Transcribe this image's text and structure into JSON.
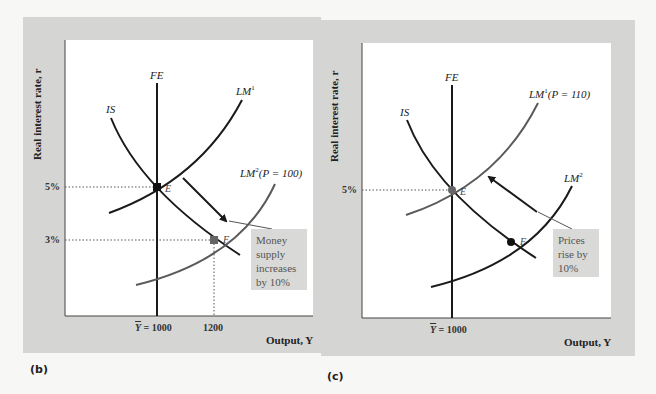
{
  "panels": [
    {
      "tag": "(b)",
      "y_axis_label": "Real interest rate, r",
      "x_axis_label": "Output, Y",
      "y_ticks": [
        "5%",
        "3%"
      ],
      "x_ticks": [
        "Y = 1000",
        "1200"
      ],
      "curves": {
        "fe": "FE",
        "is": "IS",
        "lm1": "LM",
        "lm1_sup": "1",
        "lm1_suffix": "",
        "lm2": "LM",
        "lm2_sup": "2",
        "lm2_suffix": "(P = 100)"
      },
      "points": {
        "e": "E",
        "f": "F"
      },
      "note": "Money supply increases by 10%"
    },
    {
      "tag": "(c)",
      "y_axis_label": "Real interest rate, r",
      "x_axis_label": "Output, Y",
      "y_ticks": [
        "5%"
      ],
      "x_ticks": [
        "Y = 1000"
      ],
      "curves": {
        "fe": "FE",
        "is": "IS",
        "lm1": "LM",
        "lm1_sup": "1",
        "lm1_suffix": "(P = 110)",
        "lm2": "LM",
        "lm2_sup": "2",
        "lm2_suffix": ""
      },
      "points": {
        "e": "E",
        "f": "F"
      },
      "note": "Prices rise by 10%"
    }
  ],
  "colors": {
    "panel_bg": "#d5d5d3",
    "plot_bg": "#ffffff",
    "curve_dark": "#1a1a1a",
    "curve_gray": "#5a5a5a"
  }
}
